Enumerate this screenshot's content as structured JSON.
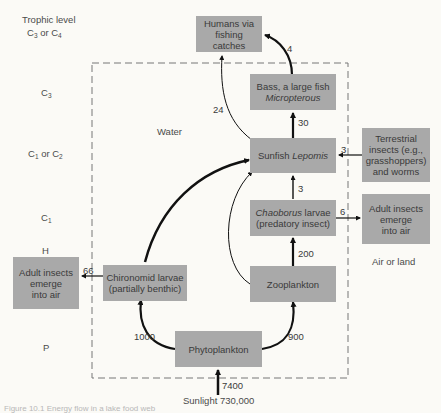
{
  "trophic_levels": {
    "header": "Trophic level",
    "levels": [
      {
        "base": "C",
        "sub": "3",
        "mid": " or ",
        "base2": "C",
        "sub2": "4"
      },
      {
        "base": "C",
        "sub": "3"
      },
      {
        "base": "C",
        "sub": "1",
        "mid": " or ",
        "base2": "C",
        "sub2": "2"
      },
      {
        "base": "C",
        "sub": "1"
      },
      {
        "text": "H"
      },
      {
        "text": "P"
      }
    ]
  },
  "regions": {
    "water": "Water",
    "air_or_land": "Air or land"
  },
  "nodes": {
    "humans": {
      "line1": "Humans via",
      "line2": "fishing catches"
    },
    "bass": {
      "line1": "Bass, a large fish",
      "line2_italic": "Micropterous"
    },
    "sunfish": {
      "plain": "Sunfish ",
      "italic": "Lepomis"
    },
    "terrestrial": {
      "line1": "Terrestrial",
      "line2": "insects (e.g.,",
      "line3": "grasshoppers)",
      "line4": "and worms"
    },
    "chaoborus": {
      "italic": "Chaoborus",
      "plain": " larvae",
      "line2": "(predatory insect)"
    },
    "adult_insects_right": {
      "line1": "Adult insects",
      "line2": "emerge",
      "line3": "into air"
    },
    "adult_insects_left": {
      "line1": "Adult insects",
      "line2": "emerge",
      "line3": "into air"
    },
    "chironomid": {
      "line1": "Chironomid larvae",
      "line2": "(partially benthic)"
    },
    "zooplankton": {
      "label": "Zooplankton"
    },
    "phytoplankton": {
      "label": "Phytoplankton"
    }
  },
  "flows": {
    "bass_to_humans": "4",
    "sunfish_to_humans": "24",
    "sunfish_to_bass": "30",
    "terrestrial_to_sunfish": "3",
    "chaoborus_to_sunfish": "3",
    "chaoborus_to_adult": "6",
    "zooplankton_to_chaoborus": "200",
    "chironomid_to_adult": "66",
    "phyto_to_chironomid": "1000",
    "phyto_to_zooplankton": "900",
    "sunlight_to_phyto": "7400"
  },
  "sunlight": {
    "label": "Sunlight 730,000"
  },
  "caption": "Figure 10.1  Energy flow in a lake food web"
}
